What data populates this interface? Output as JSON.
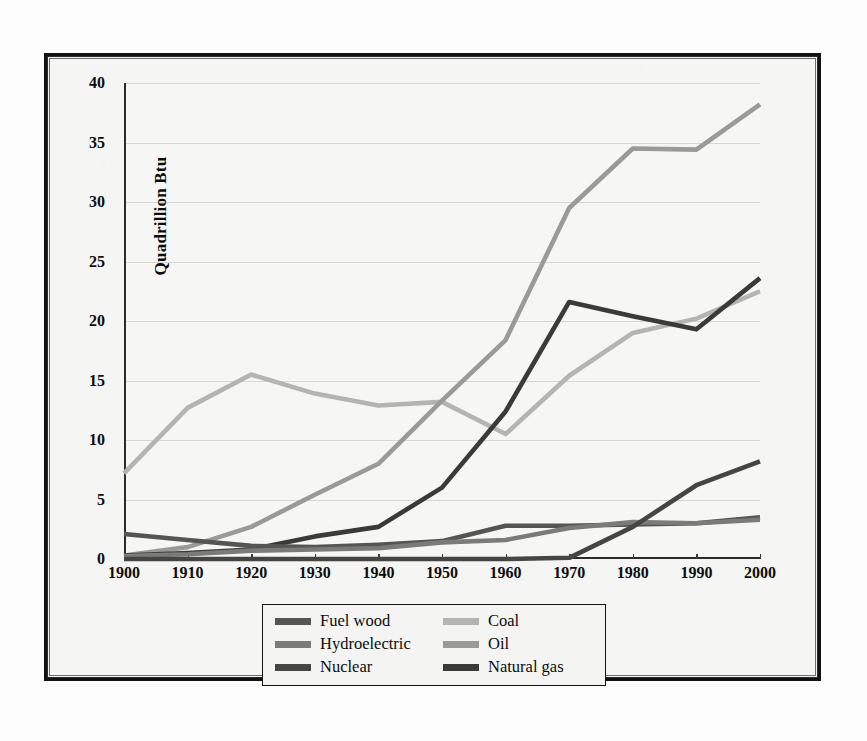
{
  "figure": {
    "y_axis_title": "Quadrillion Btu"
  },
  "legend": {
    "entries": [
      {
        "label": "Fuel wood",
        "color": "#555552"
      },
      {
        "label": "Coal",
        "color": "#b4b4b0"
      },
      {
        "label": "Hydroelectric",
        "color": "#7b7b77"
      },
      {
        "label": "Oil",
        "color": "#9a9a96"
      },
      {
        "label": "Nuclear",
        "color": "#454542"
      },
      {
        "label": "Natural gas",
        "color": "#3a3a37"
      }
    ]
  },
  "chart_data": {
    "type": "line",
    "title": "",
    "subtitle": "",
    "xlabel": "",
    "ylabel": "Quadrillion Btu",
    "x": [
      1900,
      1910,
      1920,
      1930,
      1940,
      1950,
      1960,
      1970,
      1980,
      1990,
      2000
    ],
    "xtick_labels": [
      "1900",
      "1910",
      "1920",
      "1930",
      "1940",
      "1950",
      "1960",
      "1970",
      "1980",
      "1990",
      "2000"
    ],
    "ytick_labels": [
      "0",
      "5",
      "10",
      "15",
      "20",
      "25",
      "30",
      "35",
      "40"
    ],
    "yticks": [
      0,
      5,
      10,
      15,
      20,
      25,
      30,
      35,
      40
    ],
    "xlim": [
      1900,
      2000
    ],
    "ylim": [
      0,
      40
    ],
    "grid": true,
    "legend_position": "below-plot",
    "series": [
      {
        "name": "Coal",
        "color": "#b4b4b0",
        "values": [
          7.2,
          12.7,
          15.5,
          13.9,
          12.9,
          13.2,
          10.5,
          15.4,
          19.0,
          20.2,
          22.5
        ]
      },
      {
        "name": "Oil",
        "color": "#9a9a96",
        "values": [
          0.3,
          1.0,
          2.7,
          5.4,
          8.0,
          13.3,
          18.4,
          29.5,
          34.5,
          34.4,
          38.2
        ]
      },
      {
        "name": "Natural gas",
        "color": "#3a3a37",
        "values": [
          0.3,
          0.5,
          0.8,
          1.9,
          2.7,
          6.0,
          12.4,
          21.6,
          20.4,
          19.3,
          23.6
        ]
      },
      {
        "name": "Fuel wood",
        "color": "#555552",
        "values": [
          2.1,
          1.6,
          1.1,
          1.0,
          1.2,
          1.5,
          2.8,
          2.8,
          2.9,
          3.0,
          3.5
        ]
      },
      {
        "name": "Hydroelectric",
        "color": "#7b7b77",
        "values": [
          0.25,
          0.4,
          0.7,
          0.8,
          0.9,
          1.4,
          1.6,
          2.6,
          3.1,
          3.0,
          3.3
        ]
      },
      {
        "name": "Nuclear",
        "color": "#454542",
        "values": [
          0,
          0,
          0,
          0,
          0,
          0,
          0,
          0.1,
          2.7,
          6.2,
          8.2
        ]
      }
    ]
  }
}
